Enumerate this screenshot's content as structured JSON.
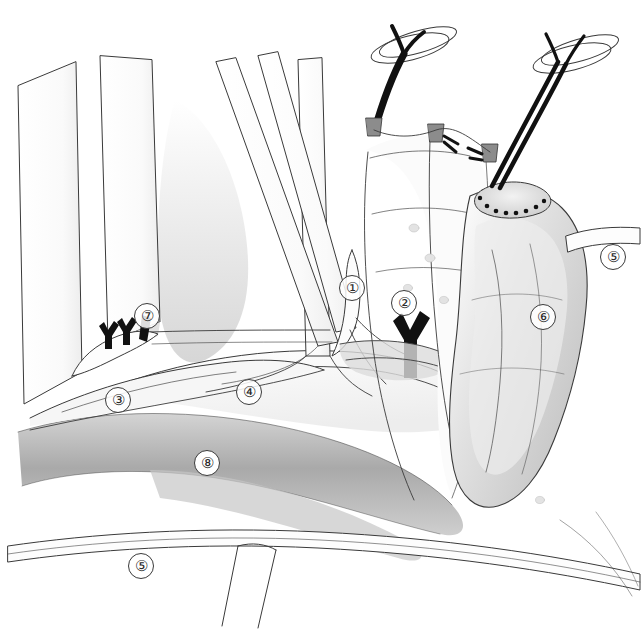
{
  "figure": {
    "type": "surgical-anatomy-illustration",
    "style": "pencil line drawing with graphite shading",
    "background_color": "#ffffff",
    "ink_color": "#3a3a3a",
    "suture_color": "#111111",
    "width": 642,
    "height": 632
  },
  "labels": [
    {
      "id": "label-1",
      "text": "①",
      "number": 1,
      "x": 352,
      "y": 288,
      "style": "plain"
    },
    {
      "id": "label-2",
      "text": "②",
      "number": 2,
      "x": 404,
      "y": 303,
      "style": "plain"
    },
    {
      "id": "label-3",
      "text": "③",
      "number": 3,
      "x": 118,
      "y": 400,
      "style": "plain"
    },
    {
      "id": "label-4",
      "text": "④",
      "number": 4,
      "x": 249,
      "y": 392,
      "style": "plain"
    },
    {
      "id": "label-5-right",
      "text": "⑤",
      "number": 5,
      "x": 603,
      "y": 245,
      "style": "plain"
    },
    {
      "id": "label-6",
      "text": "⑥",
      "number": 6,
      "x": 531,
      "y": 305,
      "style": "plain"
    },
    {
      "id": "label-7",
      "text": "⑦",
      "number": 7,
      "x": 134,
      "y": 306,
      "style": "plain"
    },
    {
      "id": "label-8",
      "text": "⑧",
      "number": 8,
      "x": 194,
      "y": 453,
      "style": "boxed"
    },
    {
      "id": "label-5-bottom",
      "text": "⑤",
      "number": 5,
      "x": 131,
      "y": 556,
      "style": "plain"
    }
  ],
  "elements": {
    "retractor_left_outer": "retractor-blade-left-outer",
    "retractor_left_inner": "retractor-blade-left-inner",
    "retractor_center": "retractor-blade-center",
    "retractor_diagonal_a": "retractor-blade-diagonal-a",
    "retractor_diagonal_b": "retractor-blade-diagonal-b",
    "clips_group": "surgical-clips-group",
    "suture_left": "suture-thread-left",
    "suture_right": "suture-thread-right",
    "ring_left": "suture-loop-left",
    "ring_right": "suture-loop-right",
    "stump": "sutured-organ-stump",
    "stump_suture_line": "stump-suture-line",
    "mesentery": "mesentery-sheet",
    "shaded_band": "shaded-tissue-band",
    "lower_vessel": "lower-vessel-pair"
  }
}
